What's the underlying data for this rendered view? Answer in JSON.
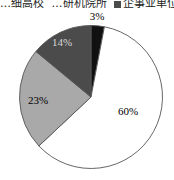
{
  "chart_data": {
    "type": "pie",
    "title": "",
    "legend": {
      "position": "top",
      "clipped": true,
      "entries": [
        "…细高校",
        "…研机院所",
        "企事业单位",
        "…"
      ]
    },
    "slices": [
      {
        "label": "3%",
        "value": 3,
        "color": "#111111",
        "label_color": "#000000"
      },
      {
        "label": "60%",
        "value": 60,
        "color": "#ffffff",
        "label_color": "#000000"
      },
      {
        "label": "23%",
        "value": 23,
        "color": "#a9a9a9",
        "label_color": "#000000"
      },
      {
        "label": "14%",
        "value": 14,
        "color": "#4b4b4b",
        "label_color": "#d8d8d8"
      }
    ],
    "start_angle": "12 o'clock",
    "direction": "clockwise",
    "stroke_color": "#555555"
  }
}
